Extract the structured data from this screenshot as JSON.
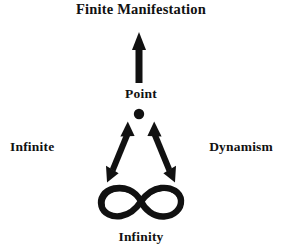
{
  "diagram": {
    "background_color": "#ffffff",
    "ink_color": "#111111",
    "title": "Finite Manifestation",
    "labels": {
      "top": "Finite Manifestation",
      "center": "Point",
      "left": "Infinite",
      "right": "Dynamism",
      "bottom": "Infinity"
    },
    "glyphs": {
      "up_arrow": "up-arrow",
      "point_dot": "filled-dot",
      "left_double_arrow": "double-headed-arrow",
      "right_double_arrow": "double-headed-arrow",
      "lemniscate": "infinity-symbol"
    }
  }
}
